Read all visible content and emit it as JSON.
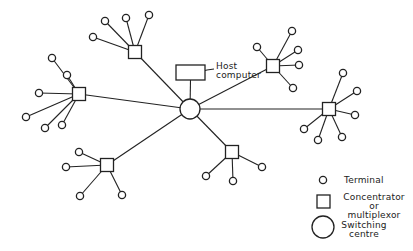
{
  "diagram": {
    "host_label_line1": "Host",
    "host_label_line2": "computer",
    "switch": {
      "x": 190,
      "y": 109,
      "r": 10
    },
    "host": {
      "x": 176,
      "y": 65,
      "w": 29,
      "h": 15
    },
    "concentrators": [
      {
        "id": "top-left",
        "x": 135,
        "y": 52,
        "terminals": [
          [
            93,
            37
          ],
          [
            105,
            21
          ],
          [
            126,
            18
          ],
          [
            149,
            15
          ]
        ]
      },
      {
        "id": "left",
        "x": 79,
        "y": 94,
        "terminals": [
          [
            52,
            58
          ],
          [
            67,
            75
          ],
          [
            39,
            93
          ],
          [
            26,
            117
          ],
          [
            45,
            128
          ],
          [
            62,
            125
          ]
        ]
      },
      {
        "id": "bottom-left",
        "x": 107,
        "y": 165,
        "terminals": [
          [
            79,
            152
          ],
          [
            66,
            167
          ],
          [
            80,
            196
          ],
          [
            122,
            195
          ]
        ]
      },
      {
        "id": "bottom-center",
        "x": 232,
        "y": 152,
        "terminals": [
          [
            206,
            176
          ],
          [
            233,
            181
          ],
          [
            262,
            167
          ]
        ]
      },
      {
        "id": "upper-right",
        "x": 273,
        "y": 66,
        "terminals": [
          [
            257,
            47
          ],
          [
            292,
            31
          ],
          [
            298,
            50
          ],
          [
            299,
            65
          ],
          [
            293,
            88
          ]
        ]
      },
      {
        "id": "right",
        "x": 329,
        "y": 109,
        "terminals": [
          [
            343,
            73
          ],
          [
            357,
            91
          ],
          [
            355,
            115
          ],
          [
            304,
            129
          ],
          [
            318,
            140
          ],
          [
            342,
            137
          ]
        ]
      }
    ]
  },
  "legend": {
    "terminal": "Terminal",
    "concentrator_line1": "Concentrator",
    "concentrator_line2": "or",
    "concentrator_line3": "multiplexor",
    "switching_line1": "Switching",
    "switching_line2": "centre"
  }
}
